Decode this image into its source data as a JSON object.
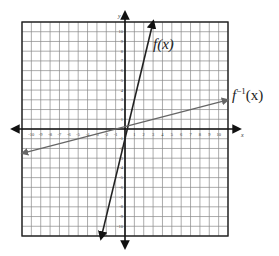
{
  "chart_data": {
    "type": "line",
    "title": "",
    "xlabel": "x",
    "ylabel": "y",
    "xlim": [
      -11,
      11
    ],
    "ylim": [
      -11,
      11
    ],
    "grid": true,
    "x_ticks": [
      -10,
      -9,
      -8,
      -7,
      -6,
      -5,
      -4,
      -3,
      -2,
      -1,
      1,
      2,
      3,
      4,
      5,
      6,
      7,
      8,
      9,
      10
    ],
    "y_ticks": [
      -10,
      -9,
      -8,
      -7,
      -6,
      -5,
      -4,
      -3,
      -2,
      -1,
      1,
      2,
      3,
      4,
      5,
      6,
      7,
      8,
      9,
      10
    ],
    "series": [
      {
        "name": "f(x)",
        "label": "f(x)",
        "slope": 4,
        "intercept": -1,
        "x_range": [
          -2.5,
          2.5
        ],
        "color": "#222222"
      },
      {
        "name": "f^-1(x)",
        "label": "f⁻¹(x)",
        "slope": 0.25,
        "intercept": 0.25,
        "x_range": [
          -11,
          11
        ],
        "color": "#666666"
      }
    ]
  },
  "labels": {
    "f": "f(x)",
    "finv_base": "f",
    "finv_sup": "−1",
    "finv_arg": "(x)",
    "x_axis": "x",
    "y_axis": "y"
  }
}
